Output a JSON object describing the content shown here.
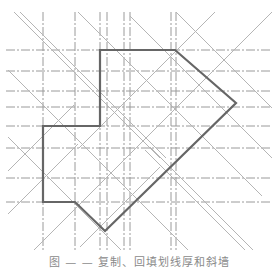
{
  "figure": {
    "caption": "图 — — 复制、回填划线厚和斜墙",
    "colors": {
      "guide_line": "#9a9a9a",
      "diagonal_line": "#b5b5b5",
      "outline": "#666666",
      "background": "#ffffff"
    },
    "horizontal_guides_y": [
      50,
      71,
      91,
      107,
      126,
      148,
      178,
      202
    ],
    "vertical_guides_x": [
      43,
      75,
      100,
      107,
      124,
      130,
      171,
      176
    ],
    "outline_polygon": [
      [
        100,
        50
      ],
      [
        175,
        50
      ],
      [
        236,
        103
      ],
      [
        105,
        231
      ],
      [
        75,
        202
      ],
      [
        43,
        202
      ],
      [
        43,
        126
      ],
      [
        100,
        126
      ]
    ],
    "diagonals": [
      {
        "x1": 14,
        "y1": 12,
        "x2": 160,
        "y2": 158
      },
      {
        "x1": 20,
        "y1": 12,
        "x2": 166,
        "y2": 158
      },
      {
        "x1": 78,
        "y1": 12,
        "x2": 262,
        "y2": 196
      },
      {
        "x1": 8,
        "y1": 70,
        "x2": 190,
        "y2": 252
      },
      {
        "x1": 8,
        "y1": 137,
        "x2": 122,
        "y2": 251
      },
      {
        "x1": 130,
        "y1": 16,
        "x2": 272,
        "y2": 158
      },
      {
        "x1": 145,
        "y1": 150,
        "x2": 250,
        "y2": 255
      },
      {
        "x1": 150,
        "y1": 147,
        "x2": 255,
        "y2": 252
      },
      {
        "x1": 176,
        "y1": 12,
        "x2": 272,
        "y2": 108
      },
      {
        "x1": 215,
        "y1": 12,
        "x2": 79,
        "y2": 148
      },
      {
        "x1": 272,
        "y1": 12,
        "x2": 33,
        "y2": 251
      },
      {
        "x1": 8,
        "y1": 214,
        "x2": 78,
        "y2": 144
      },
      {
        "x1": 8,
        "y1": 171,
        "x2": 74,
        "y2": 105
      },
      {
        "x1": 80,
        "y1": 247,
        "x2": 160,
        "y2": 167
      }
    ]
  }
}
